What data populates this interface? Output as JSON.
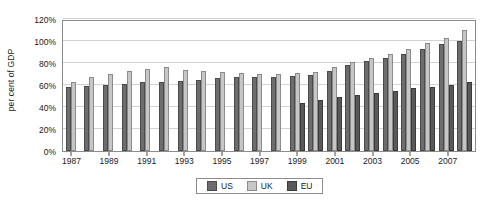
{
  "chart_data": {
    "type": "bar",
    "title": "",
    "subtitle": "",
    "xlabel": "",
    "ylabel": "per cent of GDP",
    "ylim": [
      0,
      120
    ],
    "ytick_values": [
      0,
      20,
      40,
      60,
      80,
      100,
      120
    ],
    "ytick_labels": [
      "0%",
      "20%",
      "40%",
      "60%",
      "80%",
      "100%",
      "120%"
    ],
    "grid": "horizontal",
    "legend_position": "bottom-center",
    "categories": [
      "1987",
      "1988",
      "1989",
      "1990",
      "1991",
      "1992",
      "1993",
      "1994",
      "1995",
      "1996",
      "1997",
      "1998",
      "1999",
      "2000",
      "2001",
      "2002",
      "2003",
      "2004",
      "2005",
      "2006",
      "2007",
      "2008"
    ],
    "xtick_labels": [
      "1987",
      "1989",
      "1991",
      "1993",
      "1995",
      "1997",
      "1999",
      "2001",
      "2003",
      "2005",
      "2007"
    ],
    "series": [
      {
        "name": "US",
        "color": "#6d6d6d",
        "values": [
          58,
          59,
          60,
          61,
          63,
          63,
          64,
          65,
          66,
          67,
          67,
          67,
          68,
          69,
          73,
          78,
          82,
          85,
          88,
          93,
          97,
          100
        ]
      },
      {
        "name": "UK",
        "color": "#c6c6c6",
        "values": [
          63,
          67,
          70,
          73,
          75,
          76,
          74,
          73,
          72,
          71,
          70,
          70,
          71,
          72,
          76,
          81,
          85,
          88,
          93,
          98,
          103,
          110
        ]
      },
      {
        "name": "EU",
        "color": "#595959",
        "values": [
          null,
          null,
          null,
          null,
          null,
          null,
          null,
          null,
          null,
          null,
          null,
          null,
          44,
          46,
          49,
          51,
          53,
          55,
          57,
          58,
          60,
          63
        ]
      }
    ]
  },
  "legend": {
    "items": [
      {
        "label": "US",
        "key": "us"
      },
      {
        "label": "UK",
        "key": "uk"
      },
      {
        "label": "EU",
        "key": "eu"
      }
    ]
  }
}
